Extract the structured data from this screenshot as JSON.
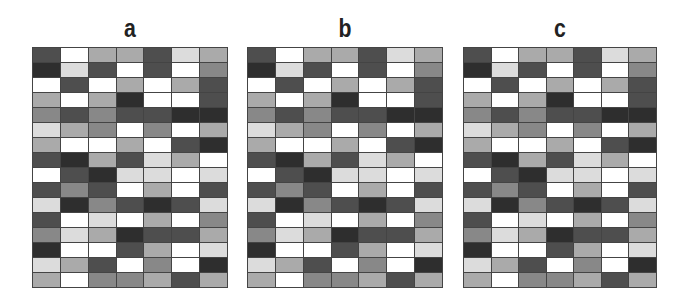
{
  "shades": [
    "#ffffff",
    "#dcdcdc",
    "#aaaaaa",
    "#888888",
    "#4e4e4e",
    "#2e2e2e"
  ],
  "panels": [
    {
      "label": "a",
      "left": 32,
      "width": 196,
      "height": 241
    },
    {
      "label": "b",
      "left": 247,
      "width": 196,
      "height": 241
    },
    {
      "label": "c",
      "left": 463,
      "width": 194,
      "height": 241
    }
  ],
  "grid": {
    "columns": 7,
    "rows": 16,
    "cells": [
      [
        4,
        0,
        2,
        2,
        4,
        1,
        2
      ],
      [
        5,
        1,
        4,
        0,
        4,
        0,
        3
      ],
      [
        0,
        4,
        0,
        2,
        0,
        2,
        4
      ],
      [
        2,
        0,
        2,
        5,
        0,
        0,
        4
      ],
      [
        3,
        4,
        3,
        4,
        4,
        5,
        5
      ],
      [
        1,
        2,
        3,
        0,
        3,
        0,
        2
      ],
      [
        2,
        0,
        0,
        2,
        0,
        4,
        5
      ],
      [
        4,
        5,
        2,
        4,
        1,
        2,
        0
      ],
      [
        0,
        4,
        5,
        1,
        1,
        0,
        1
      ],
      [
        4,
        3,
        4,
        0,
        2,
        0,
        4
      ],
      [
        1,
        5,
        3,
        4,
        5,
        4,
        1
      ],
      [
        4,
        0,
        1,
        0,
        2,
        0,
        3
      ],
      [
        3,
        1,
        2,
        5,
        4,
        4,
        2
      ],
      [
        5,
        0,
        0,
        4,
        2,
        0,
        1
      ],
      [
        1,
        2,
        4,
        0,
        3,
        0,
        5
      ],
      [
        2,
        0,
        3,
        3,
        2,
        4,
        2
      ]
    ]
  }
}
